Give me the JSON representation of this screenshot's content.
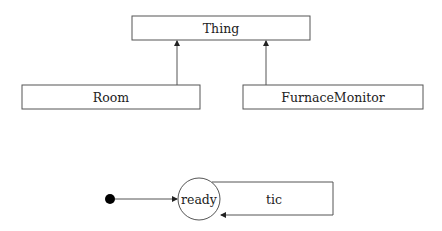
{
  "class_diagram": {
    "parent": {
      "name": "Thing"
    },
    "children": [
      {
        "name": "Room"
      },
      {
        "name": "FurnaceMonitor"
      }
    ],
    "relation": "generalization"
  },
  "state_machine": {
    "initial": "initial-pseudostate",
    "states": [
      {
        "name": "ready"
      }
    ],
    "transitions": [
      {
        "from": "initial",
        "to": "ready",
        "label": ""
      },
      {
        "from": "ready",
        "to": "ready",
        "label": "tic"
      }
    ]
  },
  "colors": {
    "stroke": "#555555",
    "fill": "#ffffff",
    "dot": "#000000",
    "text": "#222222"
  }
}
